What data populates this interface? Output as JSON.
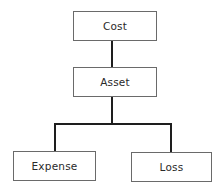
{
  "diagram": {
    "type": "hierarchy",
    "nodes": [
      {
        "id": "cost",
        "label": "Cost"
      },
      {
        "id": "asset",
        "label": "Asset"
      },
      {
        "id": "expense",
        "label": "Expense"
      },
      {
        "id": "loss",
        "label": "Loss"
      }
    ],
    "edges": [
      {
        "from": "cost",
        "to": "asset"
      },
      {
        "from": "asset",
        "to": "expense"
      },
      {
        "from": "asset",
        "to": "loss"
      }
    ],
    "colors": {
      "box_border": "#6a6a6a",
      "connector": "#1e1e1e",
      "text": "#2a2a2a",
      "background": "#ffffff"
    }
  }
}
